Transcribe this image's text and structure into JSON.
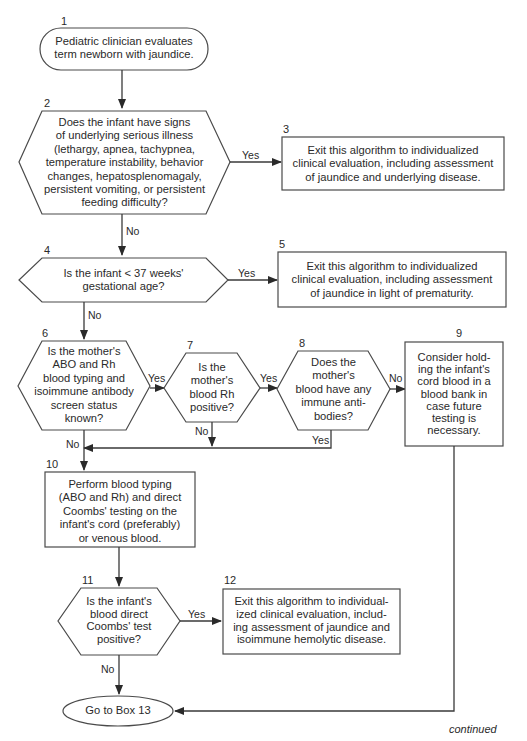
{
  "diagram": {
    "type": "flowchart",
    "continued_label": "continued",
    "nodes": [
      {
        "id": "1",
        "number": "1",
        "shape": "terminal",
        "lines": [
          "Pediatric clinician evaluates",
          "term newborn with jaundice."
        ]
      },
      {
        "id": "2",
        "number": "2",
        "shape": "decision",
        "lines": [
          "Does the infant have signs",
          "of underlying serious illness",
          "(lethargy, apnea, tachypnea,",
          "temperature instability, behavior",
          "changes, hepatosplenomagaly,",
          "persistent vomiting, or persistent",
          "feeding difficulty?"
        ]
      },
      {
        "id": "3",
        "number": "3",
        "shape": "process",
        "lines": [
          "Exit this algorithm to individualized",
          "clinical evaluation, including assessment",
          "of jaundice and underlying disease."
        ]
      },
      {
        "id": "4",
        "number": "4",
        "shape": "decision",
        "lines": [
          "Is the infant < 37 weeks'",
          "gestational age?"
        ]
      },
      {
        "id": "5",
        "number": "5",
        "shape": "process",
        "lines": [
          "Exit this algorithm to individualized",
          "clinical evaluation, including assessment",
          "of jaundice in light of prematurity."
        ]
      },
      {
        "id": "6",
        "number": "6",
        "shape": "decision",
        "lines": [
          "Is the mother's",
          "ABO and Rh",
          "blood typing and",
          "isoimmune antibody",
          "screen status",
          "known?"
        ]
      },
      {
        "id": "7",
        "number": "7",
        "shape": "decision",
        "lines": [
          "Is the",
          "mother's",
          "blood Rh",
          "positive?"
        ]
      },
      {
        "id": "8",
        "number": "8",
        "shape": "decision",
        "lines": [
          "Does the",
          "mother's",
          "blood have any",
          "immune anti-",
          "bodies?"
        ]
      },
      {
        "id": "9",
        "number": "9",
        "shape": "process",
        "lines": [
          "Consider hold-",
          "ing the infant's",
          "cord blood in a",
          "blood bank in",
          "case future",
          "testing is",
          "necessary."
        ]
      },
      {
        "id": "10",
        "number": "10",
        "shape": "process",
        "lines": [
          "Perform blood typing",
          "(ABO and Rh) and direct",
          "Coombs' testing on the",
          "infant's cord (preferably)",
          "or venous blood."
        ]
      },
      {
        "id": "11",
        "number": "11",
        "shape": "decision",
        "lines": [
          "Is the infant's",
          "blood direct",
          "Coombs' test",
          "positive?"
        ]
      },
      {
        "id": "12",
        "number": "12",
        "shape": "process",
        "lines": [
          "Exit this algorithm to individual-",
          "ized clinical evaluation, includ-",
          "ing assessment of jaundice and",
          "isoimmune hemolytic disease."
        ]
      },
      {
        "id": "13",
        "number": "",
        "shape": "terminal-oval",
        "lines": [
          "Go to Box 13"
        ]
      }
    ],
    "edges": [
      {
        "from": "1",
        "to": "2",
        "label": ""
      },
      {
        "from": "2",
        "to": "3",
        "label": "Yes"
      },
      {
        "from": "2",
        "to": "4",
        "label": "No"
      },
      {
        "from": "4",
        "to": "5",
        "label": "Yes"
      },
      {
        "from": "4",
        "to": "6",
        "label": "No"
      },
      {
        "from": "6",
        "to": "7",
        "label": "Yes"
      },
      {
        "from": "6",
        "to": "10",
        "label": "No"
      },
      {
        "from": "7",
        "to": "8",
        "label": "Yes"
      },
      {
        "from": "7",
        "to": "10",
        "label": "No"
      },
      {
        "from": "8",
        "to": "9",
        "label": "No"
      },
      {
        "from": "8",
        "to": "10",
        "label": "Yes"
      },
      {
        "from": "9",
        "to": "13",
        "label": ""
      },
      {
        "from": "10",
        "to": "11",
        "label": ""
      },
      {
        "from": "11",
        "to": "12",
        "label": "Yes"
      },
      {
        "from": "11",
        "to": "13",
        "label": "No"
      }
    ],
    "edge_labels": {
      "e2_yes": "Yes",
      "e2_no": "No",
      "e4_yes": "Yes",
      "e4_no": "No",
      "e6_yes": "Yes",
      "e6_no": "No",
      "e7_yes": "Yes",
      "e7_no": "No",
      "e8_no": "No",
      "e8_yes": "Yes",
      "e11_yes": "Yes",
      "e11_no": "No"
    }
  }
}
